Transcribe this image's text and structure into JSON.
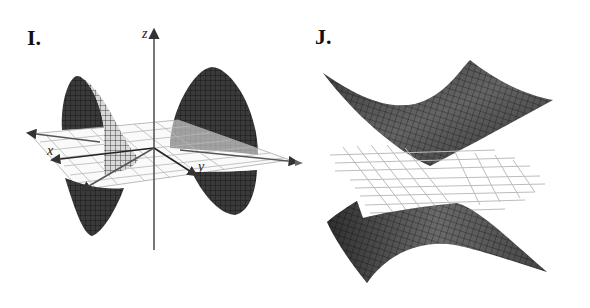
{
  "figure": {
    "panels": [
      {
        "id": "I",
        "label": "I.",
        "surface": "double-cone-like surface along x-axis with saddle sheets",
        "axes": {
          "x": "x",
          "y": "y",
          "z": "z"
        }
      },
      {
        "id": "J",
        "label": "J.",
        "surface": "two-sheeted hyperbolic surface above and below a grid plane",
        "axes": {}
      }
    ]
  },
  "colors": {
    "surface_dark": "#2a2a2a",
    "surface_mid": "#6e6e6e",
    "surface_light": "#bdbdbd",
    "grid": "#b5b5b5",
    "axis": "#333333",
    "background": "#ffffff"
  }
}
